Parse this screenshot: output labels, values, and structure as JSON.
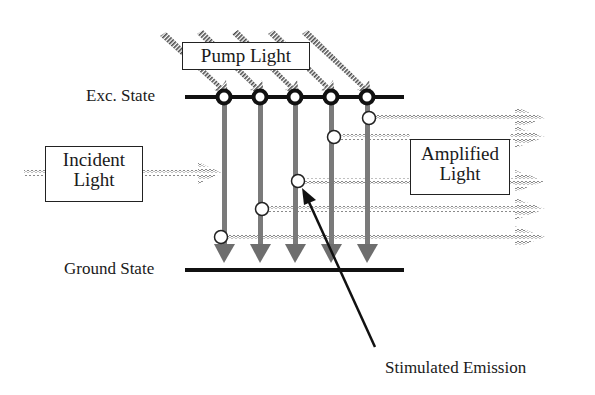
{
  "diagram": {
    "type": "stimulated-emission-energy-level-diagram",
    "labels": {
      "excited_state": "Exc. State",
      "ground_state": "Ground State",
      "pump_light": "Pump Light",
      "incident_light_line1": "Incident",
      "incident_light_line2": "Light",
      "amplified_light_line1": "Amplified",
      "amplified_light_line2": "Light",
      "stimulated_emission": "Stimulated Emission"
    },
    "levels": {
      "excited_y": 97,
      "ground_y": 270,
      "x_start": 185,
      "x_end": 404
    },
    "atoms": [
      {
        "x": 224,
        "emit_y": 237
      },
      {
        "x": 260,
        "emit_y": 209
      },
      {
        "x": 295,
        "emit_y": 181
      },
      {
        "x": 331,
        "emit_y": 137
      },
      {
        "x": 367,
        "emit_y": 118
      }
    ],
    "colors": {
      "line": "#111111",
      "transition_arrow": "#7a7a7a",
      "wave": "#9a9a9a",
      "pump_hatch": "#555555"
    }
  }
}
